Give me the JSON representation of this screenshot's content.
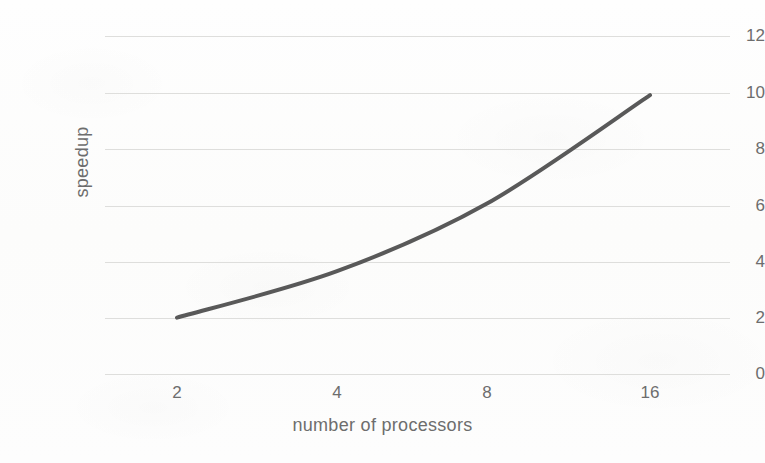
{
  "chart_data": {
    "type": "line",
    "title": "",
    "xlabel": "number of processors",
    "ylabel": "speedup",
    "categories": [
      2,
      4,
      8,
      16
    ],
    "category_labels": [
      "2",
      "4",
      "8",
      "16"
    ],
    "x_tick_labels": [
      "2",
      "4",
      "8",
      "16"
    ],
    "y_tick_labels": [
      "12",
      "10",
      "8",
      "6",
      "4",
      "2",
      "0"
    ],
    "y_ticks": [
      12,
      10,
      8,
      6,
      4,
      2,
      0
    ],
    "ylim": [
      0,
      12
    ],
    "grid": "horizontal",
    "legend": "none",
    "series": [
      {
        "name": "speedup",
        "values": [
          2.0,
          3.65,
          6.05,
          9.9
        ],
        "color": "#595959",
        "line_width": 4,
        "smooth": true,
        "markers": "none"
      }
    ],
    "axis_type": "categorical",
    "colors": {
      "line": "#595959",
      "gridline": "#dededc",
      "tick_label": "#6d6d6d",
      "axis_title": "#6d6d6d",
      "background": "#fdfdfc"
    }
  },
  "axes": {
    "y_title": "speedup",
    "x_title": "number of processors",
    "y_tick_labels": [
      {
        "text": "12",
        "value": 12
      },
      {
        "text": "10",
        "value": 10
      },
      {
        "text": "8",
        "value": 8
      },
      {
        "text": "6",
        "value": 6
      },
      {
        "text": "4",
        "value": 4
      },
      {
        "text": "2",
        "value": 2
      },
      {
        "text": "0",
        "value": 0
      }
    ],
    "x_tick_labels": [
      {
        "text": "2",
        "value": 2
      },
      {
        "text": "4",
        "value": 4
      },
      {
        "text": "8",
        "value": 8
      },
      {
        "text": "16",
        "value": 16
      }
    ]
  }
}
